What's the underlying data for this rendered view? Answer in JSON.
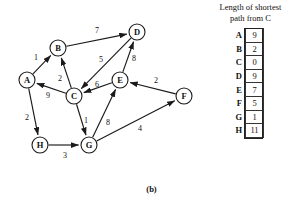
{
  "figure": {
    "caption": "(b)"
  },
  "graph": {
    "title": "directed weighted graph",
    "nodes": [
      {
        "id": "A",
        "label": "A",
        "x": 27,
        "y": 80,
        "r": 8
      },
      {
        "id": "B",
        "label": "B",
        "x": 58,
        "y": 48,
        "r": 8
      },
      {
        "id": "C",
        "label": "C",
        "x": 74,
        "y": 96,
        "r": 8
      },
      {
        "id": "D",
        "label": "D",
        "x": 137,
        "y": 32,
        "r": 8
      },
      {
        "id": "E",
        "label": "E",
        "x": 120,
        "y": 80,
        "r": 8
      },
      {
        "id": "F",
        "label": "F",
        "x": 184,
        "y": 96,
        "r": 8
      },
      {
        "id": "G",
        "label": "G",
        "x": 89,
        "y": 145,
        "r": 8
      },
      {
        "id": "H",
        "label": "H",
        "x": 40,
        "y": 145,
        "r": 8
      }
    ],
    "edges": [
      {
        "from": "A",
        "to": "B",
        "weight": "1",
        "lx": 36,
        "ly": 57
      },
      {
        "from": "C",
        "to": "B",
        "weight": "2",
        "lx": 60,
        "ly": 78
      },
      {
        "from": "B",
        "to": "D",
        "weight": "7",
        "lx": 97,
        "ly": 30
      },
      {
        "from": "D",
        "to": "C",
        "weight": "5",
        "lx": 101,
        "ly": 59
      },
      {
        "from": "E",
        "to": "D",
        "weight": "8",
        "lx": 134,
        "ly": 58
      },
      {
        "from": "E",
        "to": "C",
        "weight": "6",
        "lx": 97,
        "ly": 84
      },
      {
        "from": "C",
        "to": "A",
        "weight": "9",
        "lx": 48,
        "ly": 95
      },
      {
        "from": "A",
        "to": "H",
        "weight": "2",
        "lx": 27,
        "ly": 117
      },
      {
        "from": "C",
        "to": "G",
        "weight": "1",
        "lx": 86,
        "ly": 120
      },
      {
        "from": "H",
        "to": "G",
        "weight": "3",
        "lx": 65,
        "ly": 155
      },
      {
        "from": "G",
        "to": "E",
        "weight": "8",
        "lx": 108,
        "ly": 122
      },
      {
        "from": "G",
        "to": "F",
        "weight": "4",
        "lx": 140,
        "ly": 128
      },
      {
        "from": "F",
        "to": "E",
        "weight": "2",
        "lx": 156,
        "ly": 80
      }
    ]
  },
  "table": {
    "title_line1": "Length of shortest",
    "title_line2": "path from C",
    "rows": [
      {
        "key": "A",
        "value": "9"
      },
      {
        "key": "B",
        "value": "2"
      },
      {
        "key": "C",
        "value": "0"
      },
      {
        "key": "D",
        "value": "9"
      },
      {
        "key": "E",
        "value": "7"
      },
      {
        "key": "F",
        "value": "5"
      },
      {
        "key": "G",
        "value": "1"
      },
      {
        "key": "H",
        "value": "11"
      }
    ]
  },
  "chart_data": {
    "type": "diagram-with-table",
    "title": "Length of shortest path from C",
    "graph_type": "directed weighted graph",
    "nodes": [
      "A",
      "B",
      "C",
      "D",
      "E",
      "F",
      "G",
      "H"
    ],
    "edges": [
      [
        "A",
        "B",
        1
      ],
      [
        "C",
        "B",
        2
      ],
      [
        "B",
        "D",
        7
      ],
      [
        "D",
        "C",
        5
      ],
      [
        "E",
        "D",
        8
      ],
      [
        "E",
        "C",
        6
      ],
      [
        "C",
        "A",
        9
      ],
      [
        "A",
        "H",
        2
      ],
      [
        "C",
        "G",
        1
      ],
      [
        "H",
        "G",
        3
      ],
      [
        "G",
        "E",
        8
      ],
      [
        "G",
        "F",
        4
      ],
      [
        "F",
        "E",
        2
      ]
    ],
    "categories": [
      "A",
      "B",
      "C",
      "D",
      "E",
      "F",
      "G",
      "H"
    ],
    "values": [
      9,
      2,
      0,
      9,
      7,
      5,
      1,
      11
    ],
    "xlabel": "vertex",
    "ylabel": "shortest path length from C"
  }
}
